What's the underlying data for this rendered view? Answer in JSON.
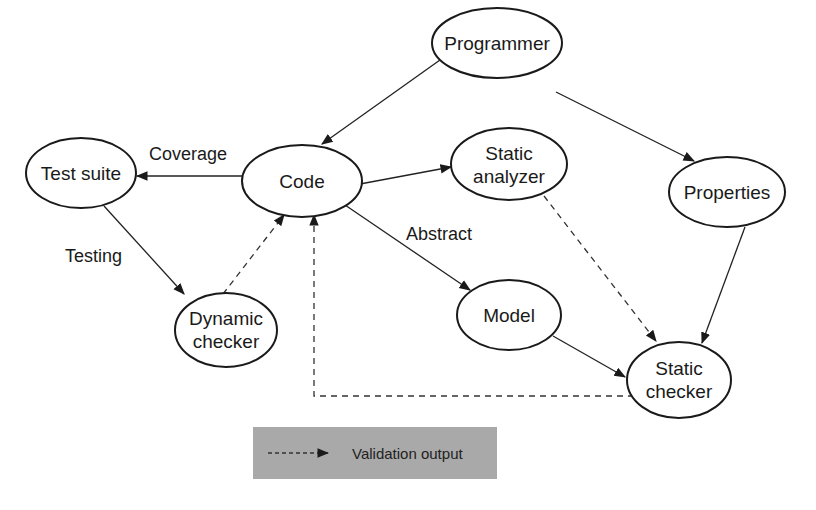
{
  "diagram": {
    "nodes": {
      "programmer": {
        "line1": "Programmer"
      },
      "test_suite": {
        "line1": "Test suite"
      },
      "code": {
        "line1": "Code"
      },
      "static_analyzer": {
        "line1": "Static",
        "line2": "analyzer"
      },
      "properties": {
        "line1": "Properties"
      },
      "dynamic_checker": {
        "line1": "Dynamic",
        "line2": "checker"
      },
      "model": {
        "line1": "Model"
      },
      "static_checker": {
        "line1": "Static",
        "line2": "checker"
      }
    },
    "edge_labels": {
      "coverage": "Coverage",
      "testing": "Testing",
      "abstract": "Abstract"
    },
    "edges": [
      {
        "from": "Programmer",
        "to": "Code",
        "style": "solid"
      },
      {
        "from": "Programmer",
        "to": "Properties",
        "style": "solid"
      },
      {
        "from": "Code",
        "to": "Test suite",
        "style": "solid",
        "label": "Coverage"
      },
      {
        "from": "Code",
        "to": "Static analyzer",
        "style": "solid"
      },
      {
        "from": "Code",
        "to": "Model",
        "style": "solid",
        "label": "Abstract"
      },
      {
        "from": "Test suite",
        "to": "Dynamic checker",
        "style": "solid",
        "label": "Testing"
      },
      {
        "from": "Dynamic checker",
        "to": "Code",
        "style": "dashed"
      },
      {
        "from": "Static analyzer",
        "to": "Static checker",
        "style": "dashed"
      },
      {
        "from": "Properties",
        "to": "Static checker",
        "style": "solid"
      },
      {
        "from": "Model",
        "to": "Static checker",
        "style": "solid"
      },
      {
        "from": "Static checker",
        "to": "Code",
        "style": "dashed"
      }
    ],
    "legend": {
      "label": "Validation output",
      "line_style": "dashed",
      "background": "#a9a9a9"
    }
  }
}
